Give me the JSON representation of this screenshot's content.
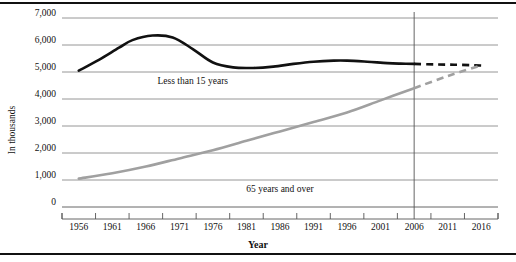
{
  "chart_data": {
    "type": "line",
    "title": "",
    "xlabel": "Year",
    "ylabel": "In thousands",
    "xlim": [
      1953.5,
      2018.5
    ],
    "ylim": [
      0,
      7000
    ],
    "grid": true,
    "legend_position": "inline-annotation",
    "x_ticks": [
      1956,
      1961,
      1966,
      1971,
      1976,
      1981,
      1986,
      1991,
      1996,
      2001,
      2006,
      2011,
      2016
    ],
    "x_tick_labels": [
      "1956",
      "1961",
      "1966",
      "1971",
      "1976",
      "1981",
      "1986",
      "1991",
      "1996",
      "2001",
      "2006",
      "2011",
      "2016"
    ],
    "y_ticks": [
      0,
      1000,
      2000,
      3000,
      4000,
      5000,
      6000,
      7000
    ],
    "y_tick_labels": [
      "0",
      "1,000",
      "2,000",
      "3,000",
      "4,000",
      "5,000",
      "6,000",
      "7,000"
    ],
    "projection_boundary_year": 2006,
    "series": [
      {
        "name": "Less than 15 years",
        "color": "#111111",
        "style": "solid-then-dashed",
        "x": [
          1956,
          1959,
          1962,
          1964,
          1967,
          1970,
          1973,
          1976,
          1979,
          1982,
          1985,
          1988,
          1991,
          1994,
          1996,
          1999,
          2002,
          2004,
          2006
        ],
        "values": [
          5050,
          5450,
          5900,
          6180,
          6350,
          6280,
          5850,
          5350,
          5170,
          5150,
          5200,
          5300,
          5380,
          5420,
          5420,
          5380,
          5330,
          5310,
          5300
        ],
        "projection_x": [
          2006,
          2009,
          2012,
          2015,
          2016
        ],
        "projection_values": [
          5300,
          5280,
          5270,
          5250,
          5240
        ]
      },
      {
        "name": "65 years and over",
        "color": "#a0a0a0",
        "style": "solid-then-dashed",
        "x": [
          1956,
          1961,
          1966,
          1971,
          1976,
          1981,
          1986,
          1991,
          1996,
          2001,
          2006
        ],
        "values": [
          1050,
          1250,
          1500,
          1800,
          2100,
          2450,
          2800,
          3150,
          3500,
          3950,
          4400
        ],
        "projection_x": [
          2006,
          2011,
          2016
        ],
        "projection_values": [
          4400,
          4850,
          5250
        ]
      }
    ],
    "annotations": [
      {
        "text": "Less than 15 years",
        "x": 1973,
        "y": 5000,
        "name": "less-than-15-years-label"
      },
      {
        "text": "65 years and over",
        "x": 1986,
        "y": 1000,
        "name": "65-years-and-over-label"
      }
    ]
  }
}
